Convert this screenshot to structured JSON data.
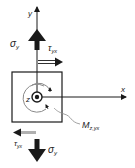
{
  "diagram": {
    "type": "stress-element",
    "axes": {
      "x_label": "x",
      "y_label": "y",
      "z_label": "z"
    },
    "labels": {
      "sigma_top": "σ",
      "sigma_top_sub": "y",
      "tau_top": "τ",
      "tau_top_sub": "yx",
      "sigma_bottom": "σ",
      "sigma_bottom_sub": "y",
      "tau_bottom": "τ",
      "tau_bottom_sub": "yx",
      "moment": "M",
      "moment_sub": "z,yx"
    },
    "colors": {
      "line": "#1a1a1a",
      "tau_bottom_arrow": "#9a9a9a",
      "moment_arc": "#8a8a8a",
      "background": "#ffffff"
    }
  }
}
